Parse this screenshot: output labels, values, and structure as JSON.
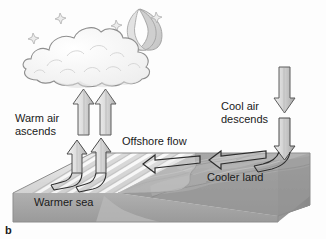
{
  "figure": {
    "panel_label": "b",
    "kind": "land-sea-breeze-night-diagram",
    "labels": {
      "warm_air": "Warm air\nascends",
      "cool_air": "Cool air\ndescends",
      "offshore_flow": "Offshore flow",
      "cooler_land": "Cooler land",
      "warmer_sea": "Warmer sea"
    },
    "sky": {
      "moon": "crescent-moon-icon",
      "cloud": "cloud-icon",
      "stars": [
        {
          "name": "star-icon",
          "x": 60,
          "y": 18,
          "r": 5
        },
        {
          "name": "star-icon",
          "x": 33,
          "y": 38,
          "r": 5
        },
        {
          "name": "star-icon",
          "x": 116,
          "y": 25,
          "r": 5
        },
        {
          "name": "star-icon",
          "x": 156,
          "y": 17,
          "r": 5
        }
      ]
    },
    "arrows": {
      "ascending": "two-upward-arrows-over-sea",
      "descending": "one-downward-arrow-over-land",
      "offshore": "two-leftward-arrows-over-surface"
    },
    "colors": {
      "ink": "#1a1a1a",
      "arrow_fill_light": "#e3e3e3",
      "arrow_fill_mid": "#b4b4b4",
      "sea_light": "#f2f2f2",
      "sea_band": "#d6d6d6",
      "land_mid": "#9a9a9a",
      "land_dark": "#8a8a8a",
      "front_face": "#a2a2a2",
      "side_face": "#8e8e8e",
      "cloud_fill": "#fbfbfb",
      "moon_fill": "#d8d8d8"
    }
  }
}
